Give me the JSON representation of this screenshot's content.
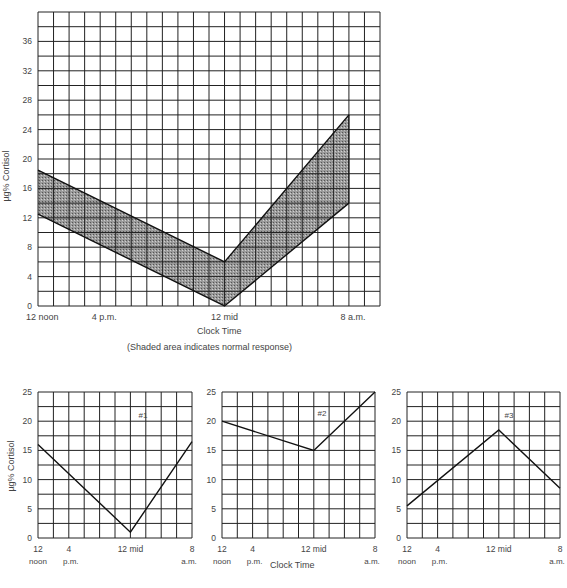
{
  "chart_data": [
    {
      "type": "area",
      "title": "",
      "xlabel": "Clock Time",
      "ylabel": "µg% Cortisol",
      "note": "(Shaded area indicates normal response)",
      "ylim": [
        0,
        40
      ],
      "yticks": [
        0,
        4,
        8,
        12,
        16,
        20,
        24,
        28,
        32,
        36
      ],
      "xtick_labels": [
        "12 noon",
        "4 p.m.",
        "12 mid",
        "8 a.m."
      ],
      "grid": true,
      "x_hours_from_noon": [
        0,
        12,
        20
      ],
      "x_labels_at_points": [
        "12 noon",
        "12 mid",
        "8 a.m."
      ],
      "series": [
        {
          "name": "Normal upper bound",
          "values": [
            18.5,
            6,
            26
          ]
        },
        {
          "name": "Normal lower bound",
          "values": [
            12.5,
            0,
            14
          ]
        }
      ]
    },
    {
      "type": "line",
      "title": "#1",
      "xlabel": "",
      "ylabel": "µg% Cortisol",
      "ylim": [
        0,
        25
      ],
      "yticks": [
        0,
        5,
        10,
        15,
        20,
        25
      ],
      "xtick_labels": [
        "12 noon",
        "4 p.m.",
        "12 mid",
        "8 a.m."
      ],
      "x": [
        "12 noon",
        "12 mid",
        "8 a.m."
      ],
      "series": [
        {
          "name": "#1",
          "values": [
            16,
            1,
            16.5
          ]
        }
      ]
    },
    {
      "type": "line",
      "title": "#2",
      "xlabel": "Clock Time",
      "ylabel": "",
      "ylim": [
        0,
        25
      ],
      "yticks": [
        0,
        5,
        10,
        15,
        20,
        25
      ],
      "xtick_labels": [
        "12 noon",
        "4 p.m.",
        "12 mid",
        "8 a.m."
      ],
      "x": [
        "12 noon",
        "12 mid",
        "8 a.m."
      ],
      "series": [
        {
          "name": "#2",
          "values": [
            20,
            15,
            25
          ]
        }
      ]
    },
    {
      "type": "line",
      "title": "#3",
      "xlabel": "",
      "ylabel": "",
      "ylim": [
        0,
        25
      ],
      "yticks": [
        0,
        5,
        10,
        15,
        20,
        25
      ],
      "xtick_labels": [
        "12 noon",
        "4 p.m.",
        "12 mid",
        "8 a.m."
      ],
      "x": [
        "12 noon",
        "12 mid",
        "8 a.m."
      ],
      "series": [
        {
          "name": "#3",
          "values": [
            5.5,
            18.5,
            8.5
          ]
        }
      ]
    }
  ],
  "labels": {
    "main_ylabel": "µg% Cortisol",
    "main_xlabel": "Clock Time",
    "main_note": "(Shaded area indicates normal response)",
    "main_xticks": [
      "12 noon",
      "4 p.m.",
      "12 mid",
      "8 a.m."
    ],
    "small_ylabel": "µg% Cortisol",
    "small_xlabel": "Clock Time",
    "small_xticks_top": [
      "12",
      "4",
      "12 mid",
      "8"
    ],
    "small_xticks_bottom": [
      "noon",
      "p.m.",
      "a.m."
    ],
    "chart1_title": "#1",
    "chart2_title": "#2",
    "chart3_title": "#3"
  }
}
